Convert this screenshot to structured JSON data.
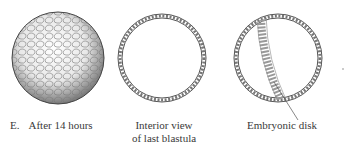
{
  "figure": {
    "panels": [
      {
        "id": "after-14-hours",
        "letter": "E.",
        "caption": "After 14 hours"
      },
      {
        "id": "interior-view",
        "caption_line1": "Interior view",
        "caption_line2": "of last blastula"
      },
      {
        "id": "embryonic-disk",
        "caption": "Embryonic disk"
      }
    ],
    "colors": {
      "ink": "#3a3a3a",
      "background": "#ffffff"
    }
  }
}
